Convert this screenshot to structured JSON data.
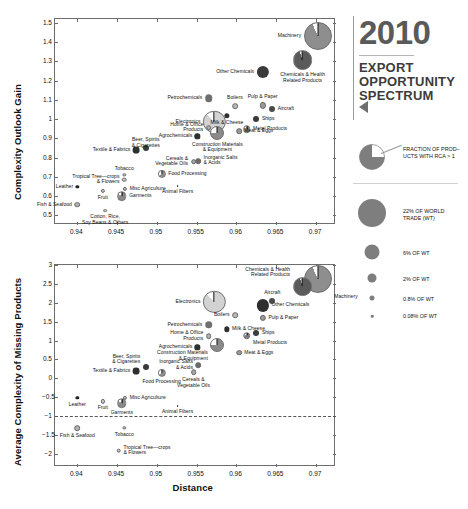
{
  "title_block": {
    "year": "2010",
    "line1": "EXPORT",
    "line2": "OPPORTUNITY",
    "line3": "SPECTRUM",
    "arrow_icon": "left-triangle-icon"
  },
  "legend": {
    "pie_note_line1": "FRACTION OF PROD–",
    "pie_note_line2": "UCTS WITH RCA > 1",
    "sizes": [
      {
        "label_line1": "22% OF WORLD",
        "label_line2": "TRADE (WT)",
        "px": 26
      },
      {
        "label_line1": "6% OF WT",
        "label_line2": "",
        "px": 14
      },
      {
        "label_line1": "2% OF WT",
        "label_line2": "",
        "px": 8
      },
      {
        "label_line1": "0.8% OF WT",
        "label_line2": "",
        "px": 5
      },
      {
        "label_line1": "0.08% OF WT",
        "label_line2": "",
        "px": 2.5
      }
    ]
  },
  "chart_data": [
    {
      "id": "top",
      "type": "scatter",
      "title": "",
      "xlabel": "",
      "ylabel": "Complexity Outlook Gain",
      "xlim": [
        0.9372,
        0.9725
      ],
      "ylim": [
        0.45,
        1.52
      ],
      "xticks": [
        0.94,
        0.945,
        0.95,
        0.955,
        0.96,
        0.965,
        0.97
      ],
      "xticklabels": [
        "0.94",
        "0.945",
        "0.95",
        "0.955",
        "0.96",
        "0.965",
        "0.97"
      ],
      "yticks": [
        0.5,
        0.6,
        0.7,
        0.8,
        0.9,
        1.0,
        1.1,
        1.2,
        1.3,
        1.4,
        1.5
      ],
      "yticklabels": [
        "0.5",
        "0.6",
        "0.7",
        "0.8",
        "0.9",
        "1",
        "1.1",
        "1.2",
        "1.3",
        "1.4",
        "1.5"
      ],
      "grid": false,
      "legend_position": "external-right",
      "points": [
        {
          "name": "Machinery",
          "x": 0.9702,
          "y": 1.434,
          "size_pct": 22.0,
          "rca": 0.93,
          "shade": "#8e8e8e",
          "label_pos": "left"
        },
        {
          "name": "Chemicals & Health\nRelated Products",
          "x": 0.9683,
          "y": 1.305,
          "size_pct": 11.0,
          "rca": 0.95,
          "shade": "#5a5a5a",
          "label_pos": "below"
        },
        {
          "name": "Other Chemicals",
          "x": 0.9633,
          "y": 1.247,
          "size_pct": 4.2,
          "rca": 1.0,
          "shade": "#3a3a3a",
          "label_pos": "left"
        },
        {
          "name": "Petrochemicals",
          "x": 0.9565,
          "y": 1.108,
          "size_pct": 1.6,
          "rca": 1.0,
          "shade": "#6f6f6f",
          "label_pos": "left"
        },
        {
          "name": "Boilers",
          "x": 0.9598,
          "y": 1.068,
          "size_pct": 0.9,
          "rca": 0.6,
          "shade": "#b9b9b9",
          "label_pos": "above"
        },
        {
          "name": "Pulp & Paper",
          "x": 0.9633,
          "y": 1.072,
          "size_pct": 1.1,
          "rca": 0.7,
          "shade": "#9a9a9a",
          "label_pos": "above"
        },
        {
          "name": "Aircraft",
          "x": 0.9645,
          "y": 1.051,
          "size_pct": 1.0,
          "rca": 1.0,
          "shade": "#4a4a4a",
          "label_pos": "right"
        },
        {
          "name": "Electronics",
          "x": 0.9572,
          "y": 0.985,
          "size_pct": 14.0,
          "rca": 0.88,
          "shade": "#d2d2d2",
          "label_pos": "left"
        },
        {
          "name": "Milk & Cheese",
          "x": 0.9588,
          "y": 1.018,
          "size_pct": 0.8,
          "rca": 1.0,
          "shade": "#2f2f2f",
          "label_pos": "below"
        },
        {
          "name": "Ships",
          "x": 0.9625,
          "y": 0.998,
          "size_pct": 1.0,
          "rca": 1.0,
          "shade": "#3a3a3a",
          "label_pos": "right"
        },
        {
          "name": "Metal Products",
          "x": 0.9613,
          "y": 0.948,
          "size_pct": 1.6,
          "rca": 0.8,
          "shade": "#7a7a7a",
          "label_pos": "right"
        },
        {
          "name": "Home & Office\nProducts",
          "x": 0.9565,
          "y": 0.955,
          "size_pct": 0.9,
          "rca": 0.55,
          "shade": "#b0b0b0",
          "label_pos": "left"
        },
        {
          "name": "Construction Materials\n& Equipment",
          "x": 0.9576,
          "y": 0.93,
          "size_pct": 5.5,
          "rca": 0.75,
          "shade": "#8a8a8a",
          "label_pos": "below"
        },
        {
          "name": "Meat & Eggs",
          "x": 0.9603,
          "y": 0.938,
          "size_pct": 0.9,
          "rca": 0.6,
          "shade": "#9a9a9a",
          "label_pos": "right"
        },
        {
          "name": "Agrochemicals",
          "x": 0.9551,
          "y": 0.91,
          "size_pct": 0.8,
          "rca": 1.0,
          "shade": "#2f2f2f",
          "label_pos": "left"
        },
        {
          "name": "Beer, Spirits\n& Cigarettes",
          "x": 0.9486,
          "y": 0.849,
          "size_pct": 1.0,
          "rca": 1.0,
          "shade": "#3a3a3a",
          "label_pos": "above"
        },
        {
          "name": "Textile & Fabrics",
          "x": 0.9474,
          "y": 0.838,
          "size_pct": 1.3,
          "rca": 1.0,
          "shade": "#2f2f2f",
          "label_pos": "left"
        },
        {
          "name": "Inorganic Salts\n& Acids",
          "x": 0.9552,
          "y": 0.783,
          "size_pct": 0.9,
          "rca": 0.85,
          "shade": "#6a6a6a",
          "label_pos": "right"
        },
        {
          "name": "Cereals &\nVegetable Oils",
          "x": 0.9546,
          "y": 0.779,
          "size_pct": 0.9,
          "rca": 0.5,
          "shade": "#a6a6a6",
          "label_pos": "left"
        },
        {
          "name": "Food Processing",
          "x": 0.9506,
          "y": 0.716,
          "size_pct": 1.9,
          "rca": 0.65,
          "shade": "#8a8a8a",
          "label_pos": "right"
        },
        {
          "name": "Tobacco",
          "x": 0.9459,
          "y": 0.709,
          "size_pct": 0.3,
          "rca": 0.35,
          "shade": "#d8d8d8",
          "label_pos": "above"
        },
        {
          "name": "Tropical Tree—crops\n& Flowers",
          "x": 0.9459,
          "y": 0.686,
          "size_pct": 0.6,
          "rca": 0.4,
          "shade": "#c8c8c8",
          "label_pos": "left"
        },
        {
          "name": "Misc Agriculture",
          "x": 0.946,
          "y": 0.639,
          "size_pct": 0.5,
          "rca": 0.5,
          "shade": "#bcbcbc",
          "label_pos": "right"
        },
        {
          "name": "Leather",
          "x": 0.94,
          "y": 0.648,
          "size_pct": 0.3,
          "rca": 1.0,
          "shade": "#222222",
          "label_pos": "left"
        },
        {
          "name": "Animal Fibers",
          "x": 0.9526,
          "y": 0.653,
          "size_pct": 0.1,
          "rca": 1.0,
          "shade": "#222222",
          "label_pos": "below"
        },
        {
          "name": "Fruit",
          "x": 0.9432,
          "y": 0.626,
          "size_pct": 0.5,
          "rca": 0.45,
          "shade": "#cccccc",
          "label_pos": "below"
        },
        {
          "name": "Garments",
          "x": 0.9456,
          "y": 0.6,
          "size_pct": 2.6,
          "rca": 0.85,
          "shade": "#8a8a8a",
          "label_pos": "right"
        },
        {
          "name": "Fish & Seafood",
          "x": 0.94,
          "y": 0.555,
          "size_pct": 0.9,
          "rca": 0.4,
          "shade": "#b2b2b2",
          "label_pos": "left"
        },
        {
          "name": "Cotton, Rice,\nSoy Beans & Others",
          "x": 0.9435,
          "y": 0.525,
          "size_pct": 0.4,
          "rca": 0.35,
          "shade": "#d4d4d4",
          "label_pos": "below"
        }
      ]
    },
    {
      "id": "bottom",
      "type": "scatter",
      "title": "",
      "xlabel": "Distance",
      "ylabel": "Average Complexity of Missing Products",
      "xlim": [
        0.9372,
        0.9725
      ],
      "ylim": [
        -2.35,
        3.0
      ],
      "xticks": [
        0.94,
        0.945,
        0.95,
        0.955,
        0.96,
        0.965,
        0.97
      ],
      "xticklabels": [
        "0.94",
        "0.945",
        "0.95",
        "0.955",
        "0.96",
        "0.965",
        "0.97"
      ],
      "yticks": [
        -2,
        -1.5,
        -1,
        -0.5,
        0,
        0.5,
        1,
        1.5,
        2,
        2.5,
        3
      ],
      "yticklabels": [
        "−2",
        "−1.5",
        "−1",
        "−0.5",
        "0",
        "0.5",
        "1",
        "1.5",
        "2",
        "2.5",
        "3"
      ],
      "grid": false,
      "reference_line": {
        "y": -1.0,
        "style": "dashed"
      },
      "points": [
        {
          "name": "Machinery",
          "x": 0.9702,
          "y": 2.62,
          "size_pct": 22.0,
          "rca": 0.93,
          "shade": "#8e8e8e",
          "label_pos": "below-right"
        },
        {
          "name": "Chemicals & Health\nRelated Products",
          "x": 0.9683,
          "y": 2.43,
          "size_pct": 11.0,
          "rca": 0.95,
          "shade": "#5a5a5a",
          "label_pos": "above-left"
        },
        {
          "name": "Aircraft",
          "x": 0.9645,
          "y": 2.05,
          "size_pct": 1.0,
          "rca": 1.0,
          "shade": "#4a4a4a",
          "label_pos": "above"
        },
        {
          "name": "Electronics",
          "x": 0.9572,
          "y": 2.03,
          "size_pct": 14.0,
          "rca": 0.88,
          "shade": "#d2d2d2",
          "label_pos": "left"
        },
        {
          "name": "Other Chemicals",
          "x": 0.9633,
          "y": 1.93,
          "size_pct": 4.2,
          "rca": 1.0,
          "shade": "#2f2f2f",
          "label_pos": "right"
        },
        {
          "name": "Boilers",
          "x": 0.9598,
          "y": 1.67,
          "size_pct": 0.9,
          "rca": 0.6,
          "shade": "#b9b9b9",
          "label_pos": "left"
        },
        {
          "name": "Pulp & Paper",
          "x": 0.9633,
          "y": 1.6,
          "size_pct": 1.1,
          "rca": 0.7,
          "shade": "#9a9a9a",
          "label_pos": "right"
        },
        {
          "name": "Petrochemicals",
          "x": 0.9565,
          "y": 1.42,
          "size_pct": 1.6,
          "rca": 1.0,
          "shade": "#6f6f6f",
          "label_pos": "left"
        },
        {
          "name": "Milk & Cheese",
          "x": 0.9588,
          "y": 1.3,
          "size_pct": 0.8,
          "rca": 1.0,
          "shade": "#2f2f2f",
          "label_pos": "right"
        },
        {
          "name": "Ships",
          "x": 0.9625,
          "y": 1.19,
          "size_pct": 1.0,
          "rca": 1.0,
          "shade": "#3a3a3a",
          "label_pos": "right"
        },
        {
          "name": "Home & Office\nProducts",
          "x": 0.9565,
          "y": 1.11,
          "size_pct": 0.9,
          "rca": 0.55,
          "shade": "#b0b0b0",
          "label_pos": "left"
        },
        {
          "name": "Metal Products",
          "x": 0.9613,
          "y": 1.13,
          "size_pct": 1.6,
          "rca": 0.8,
          "shade": "#7a7a7a",
          "label_pos": "below-right"
        },
        {
          "name": "Agrochemicals",
          "x": 0.9551,
          "y": 0.82,
          "size_pct": 0.8,
          "rca": 1.0,
          "shade": "#2f2f2f",
          "label_pos": "left"
        },
        {
          "name": "Construction Materials\n& Equipment",
          "x": 0.9576,
          "y": 0.88,
          "size_pct": 5.5,
          "rca": 0.75,
          "shade": "#8a8a8a",
          "label_pos": "below-left"
        },
        {
          "name": "Meat & Eggs",
          "x": 0.9603,
          "y": 0.68,
          "size_pct": 0.9,
          "rca": 0.6,
          "shade": "#9a9a9a",
          "label_pos": "right"
        },
        {
          "name": "Beer, Spirits\n& Cigarettes",
          "x": 0.9486,
          "y": 0.31,
          "size_pct": 1.0,
          "rca": 1.0,
          "shade": "#3a3a3a",
          "label_pos": "above-left"
        },
        {
          "name": "Inorganic Salts\n& Acids",
          "x": 0.9552,
          "y": 0.35,
          "size_pct": 0.9,
          "rca": 0.85,
          "shade": "#6a6a6a",
          "label_pos": "left"
        },
        {
          "name": "Textile & Fabrics",
          "x": 0.9474,
          "y": 0.2,
          "size_pct": 1.3,
          "rca": 1.0,
          "shade": "#2f2f2f",
          "label_pos": "left"
        },
        {
          "name": "Food Processing",
          "x": 0.9506,
          "y": 0.15,
          "size_pct": 1.9,
          "rca": 0.65,
          "shade": "#8a8a8a",
          "label_pos": "below"
        },
        {
          "name": "Cereals &\nVegetable Oils",
          "x": 0.9546,
          "y": 0.16,
          "size_pct": 0.9,
          "rca": 0.5,
          "shade": "#a6a6a6",
          "label_pos": "below"
        },
        {
          "name": "Misc Agriculture",
          "x": 0.946,
          "y": -0.51,
          "size_pct": 0.5,
          "rca": 0.5,
          "shade": "#bcbcbc",
          "label_pos": "right"
        },
        {
          "name": "Leather",
          "x": 0.94,
          "y": -0.52,
          "size_pct": 0.3,
          "rca": 1.0,
          "shade": "#222222",
          "label_pos": "below"
        },
        {
          "name": "Fruit",
          "x": 0.9432,
          "y": -0.61,
          "size_pct": 0.5,
          "rca": 0.45,
          "shade": "#cccccc",
          "label_pos": "below"
        },
        {
          "name": "Garments",
          "x": 0.9456,
          "y": -0.66,
          "size_pct": 2.6,
          "rca": 0.85,
          "shade": "#8a8a8a",
          "label_pos": "below"
        },
        {
          "name": "Animal Fibers",
          "x": 0.9526,
          "y": -0.73,
          "size_pct": 0.1,
          "rca": 1.0,
          "shade": "#222222",
          "label_pos": "below"
        },
        {
          "name": "Fish & Seafood",
          "x": 0.94,
          "y": -1.32,
          "size_pct": 0.9,
          "rca": 0.4,
          "shade": "#b2b2b2",
          "label_pos": "below"
        },
        {
          "name": "Tobacco",
          "x": 0.9459,
          "y": -1.32,
          "size_pct": 0.3,
          "rca": 0.35,
          "shade": "#d8d8d8",
          "label_pos": "below"
        },
        {
          "name": "Tropical Tree—crops\n& Flowers",
          "x": 0.9452,
          "y": -1.92,
          "size_pct": 0.6,
          "rca": 0.4,
          "shade": "#c8c8c8",
          "label_pos": "right"
        }
      ]
    }
  ]
}
